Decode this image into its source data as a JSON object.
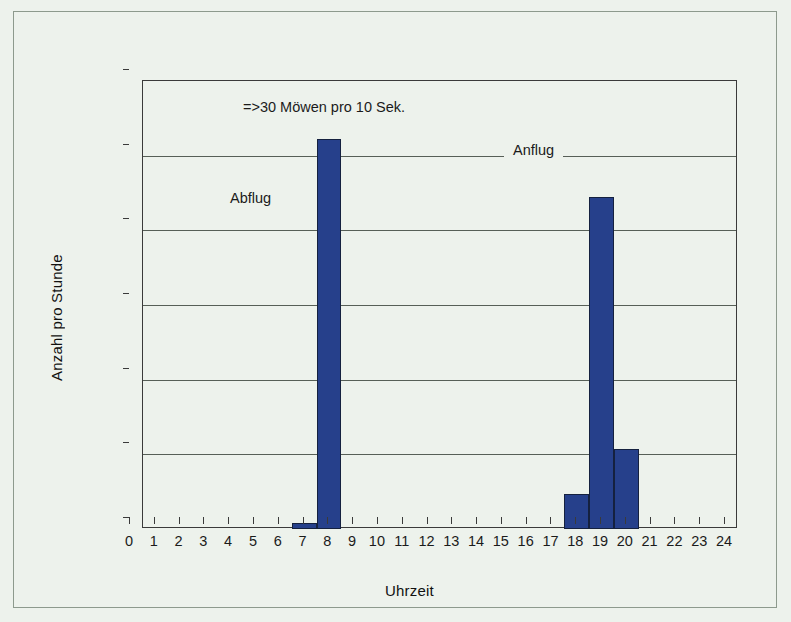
{
  "chart_data": {
    "type": "bar",
    "title": "",
    "xlabel": "Uhrzeit",
    "ylabel": "Anzahl pro Stunde",
    "categories": [
      "0",
      "1",
      "2",
      "3",
      "4",
      "5",
      "6",
      "7",
      "8",
      "9",
      "10",
      "11",
      "12",
      "13",
      "14",
      "15",
      "16",
      "17",
      "18",
      "19",
      "20",
      "21",
      "22",
      "23",
      "24"
    ],
    "bars": [
      {
        "hour": "6",
        "x_start": 6,
        "x_end": 7,
        "value": 170
      },
      {
        "hour": "7",
        "x_start": 7,
        "x_end": 8,
        "value": 10450
      },
      {
        "hour": "17",
        "x_start": 17,
        "x_end": 18,
        "value": 950
      },
      {
        "hour": "18",
        "x_start": 18,
        "x_end": 19,
        "value": 8880
      },
      {
        "hour": "19",
        "x_start": 19,
        "x_end": 20,
        "value": 2150
      }
    ],
    "values": [
      0,
      0,
      0,
      0,
      0,
      0,
      170,
      10450,
      0,
      0,
      0,
      0,
      0,
      0,
      0,
      0,
      0,
      950,
      8880,
      2150,
      0,
      0,
      0,
      0,
      0
    ],
    "ylim": [
      0,
      12000
    ],
    "xlim": [
      0,
      24
    ],
    "yticks": [
      "0",
      "2.000",
      "4.000",
      "6.000",
      "8.000",
      "10.000",
      "12.000"
    ],
    "ytick_values": [
      0,
      2000,
      4000,
      6000,
      8000,
      10000,
      12000
    ],
    "grid": true,
    "legend": "none",
    "annotations": [
      {
        "id": "note",
        "text": "=>30 Möwen pro 10 Sek."
      },
      {
        "id": "abflug",
        "text": "Abflug"
      },
      {
        "id": "anflug",
        "text": "Anflug"
      }
    ],
    "colors": {
      "bar_fill": "#26408b",
      "bar_edge": "#15213f",
      "background": "#edf2ec",
      "axis": "#3a3a3a",
      "grid": "#575f57",
      "text": "#1b1b1b"
    }
  },
  "axis": {
    "x_title": "Uhrzeit",
    "y_title": "Anzahl pro Stunde"
  },
  "annotations": {
    "note": "=>30 Möwen pro 10 Sek.",
    "abflug": "Abflug",
    "anflug": "Anflug"
  }
}
